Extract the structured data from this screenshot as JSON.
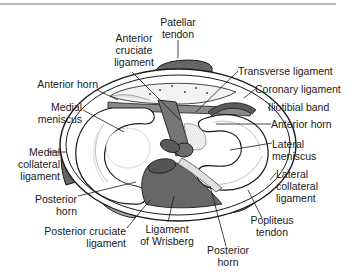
{
  "figure": {
    "colors": {
      "ink": "#1a1a1a",
      "shade_dark": "#6b6b6b",
      "shade_mid": "#9a9a9a",
      "shade_light": "#e9e9e9",
      "rule": "#b9b9b9"
    }
  },
  "labels": {
    "patellar_tendon": [
      "Patellar",
      "tendon"
    ],
    "anterior_cruciate_ligament": [
      "Anterior",
      "cruciate",
      "ligament"
    ],
    "anterior_horn_medial": "Anterior horn",
    "medial_meniscus": [
      "Medial",
      "meniscus"
    ],
    "medial_collateral_ligament": [
      "Medial",
      "collateral",
      "ligament"
    ],
    "posterior_horn_medial": [
      "Posterior",
      "horn"
    ],
    "posterior_cruciate_ligament": [
      "Posterior cruciate",
      "ligament"
    ],
    "ligament_of_wrisberg": [
      "Ligament",
      "of Wrisberg"
    ],
    "posterior_horn_lateral": [
      "Posterior",
      "horn"
    ],
    "popliteus_tendon": [
      "Popliteus",
      "tendon"
    ],
    "lateral_collateral_ligament": [
      "Lateral",
      "collateral",
      "ligament"
    ],
    "lateral_meniscus": [
      "Lateral",
      "meniscus"
    ],
    "anterior_horn_lateral": "Anterior horn",
    "iliotibial_band": "Iliotibial band",
    "coronary_ligament": "Coronary ligament",
    "transverse_ligament": "Transverse ligament"
  }
}
